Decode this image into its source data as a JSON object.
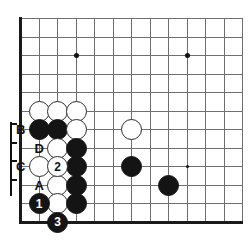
{
  "diagram": {
    "kind": "go-board-problem",
    "title": "",
    "board": {
      "origin_x": 20,
      "origin_y": 18,
      "spacing": 18.5,
      "cols": 13,
      "rows": 11,
      "edges": [
        "left",
        "bottom"
      ],
      "line_color": "#6f6f6f",
      "edge_color": "#1a1a1a",
      "background": "#ffffff"
    },
    "star_points": [
      {
        "name": "star-point-upper-left",
        "col": 3,
        "row": 2,
        "size": 5
      },
      {
        "name": "star-point-upper-right",
        "col": 9,
        "row": 2,
        "size": 5
      },
      {
        "name": "star-point-lower-right",
        "col": 9,
        "row": 8,
        "size": 3
      }
    ],
    "stones": [
      {
        "name": "white-stone-c5",
        "color": "white",
        "col": 1,
        "row": 5,
        "label": ""
      },
      {
        "name": "white-stone-d5",
        "color": "white",
        "col": 2,
        "row": 5,
        "label": ""
      },
      {
        "name": "white-stone-e5",
        "color": "white",
        "col": 3,
        "row": 5,
        "label": ""
      },
      {
        "name": "black-stone-c6",
        "color": "black",
        "col": 1,
        "row": 6,
        "label": ""
      },
      {
        "name": "black-stone-d6",
        "color": "black",
        "col": 2,
        "row": 6,
        "label": ""
      },
      {
        "name": "white-stone-e6",
        "color": "white",
        "col": 3,
        "row": 6,
        "label": ""
      },
      {
        "name": "white-stone-d7",
        "color": "white",
        "col": 2,
        "row": 7,
        "label": ""
      },
      {
        "name": "black-stone-e7",
        "color": "black",
        "col": 3,
        "row": 7,
        "label": ""
      },
      {
        "name": "white-stone-c8",
        "color": "white",
        "col": 1,
        "row": 8,
        "label": ""
      },
      {
        "name": "white-stone-move-2",
        "color": "white",
        "col": 2,
        "row": 8,
        "label": "2"
      },
      {
        "name": "black-stone-e8",
        "color": "black",
        "col": 3,
        "row": 8,
        "label": ""
      },
      {
        "name": "white-stone-d9",
        "color": "white",
        "col": 2,
        "row": 9,
        "label": ""
      },
      {
        "name": "black-stone-e9",
        "color": "black",
        "col": 3,
        "row": 9,
        "label": ""
      },
      {
        "name": "black-stone-move-1",
        "color": "black",
        "col": 1,
        "row": 10,
        "label": "1"
      },
      {
        "name": "white-stone-d10",
        "color": "white",
        "col": 2,
        "row": 10,
        "label": ""
      },
      {
        "name": "black-stone-e10",
        "color": "black",
        "col": 3,
        "row": 10,
        "label": ""
      },
      {
        "name": "black-stone-move-3",
        "color": "black",
        "col": 2,
        "row": 11,
        "label": "3"
      },
      {
        "name": "white-stone-h6",
        "color": "white",
        "col": 6,
        "row": 6,
        "label": ""
      },
      {
        "name": "black-stone-h8",
        "color": "black",
        "col": 6,
        "row": 8,
        "label": ""
      },
      {
        "name": "black-stone-i9",
        "color": "black",
        "col": 8,
        "row": 9,
        "label": ""
      }
    ],
    "point_labels": [
      {
        "name": "point-label-b",
        "text": "B",
        "col": 0,
        "row": 6
      },
      {
        "name": "point-label-d",
        "text": "D",
        "col": 1,
        "row": 7
      },
      {
        "name": "point-label-c",
        "text": "C",
        "col": 0,
        "row": 8
      },
      {
        "name": "point-label-a",
        "text": "A",
        "col": 1,
        "row": 9
      }
    ],
    "stone_radius": 10.5
  }
}
